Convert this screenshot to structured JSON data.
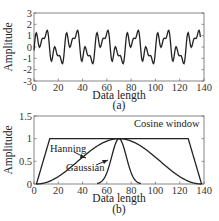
{
  "chart_data": [
    {
      "id": "a",
      "type": "line",
      "caption": "(a)",
      "xlabel": "Data length",
      "ylabel": "Amplitude",
      "xlim": [
        0,
        140
      ],
      "ylim": [
        -3,
        3
      ],
      "xticks": [
        "0",
        "20",
        "40",
        "60",
        "80",
        "100",
        "120",
        "140"
      ],
      "yticks": [
        "-3",
        "-2",
        "-1",
        "0",
        "1",
        "2",
        "3"
      ],
      "grid": false,
      "series": [
        {
          "name": "signal",
          "description": "periodic multi-harmonic signal, period ~25 samples",
          "x": [
            0,
            2,
            5,
            8,
            10,
            12,
            15,
            17,
            19,
            21,
            23,
            25,
            27,
            29,
            31,
            33,
            35,
            37
          ],
          "y": [
            0,
            0.8,
            -1.1,
            -0.7,
            -1.8,
            -0.5,
            1.7,
            0.8,
            1.2,
            -0.8,
            0.8,
            -1.1,
            -0.7,
            -1.8,
            -0.5,
            1.7,
            0.8,
            1.2
          ]
        }
      ]
    },
    {
      "id": "b",
      "type": "line",
      "caption": "(b)",
      "xlabel": "Data length",
      "ylabel": "Amplitude",
      "xlim": [
        0,
        140
      ],
      "ylim": [
        0,
        1.5
      ],
      "xticks": [
        "0",
        "20",
        "40",
        "60",
        "80",
        "100",
        "120",
        "140"
      ],
      "yticks": [
        "0",
        "0.5",
        "1",
        "1.5"
      ],
      "grid": false,
      "series": [
        {
          "name": "Cosine window",
          "x": [
            2,
            13,
            127,
            138
          ],
          "y": [
            0,
            1,
            1,
            0
          ]
        },
        {
          "name": "Hanning",
          "x": [
            2,
            20,
            40,
            70,
            100,
            120,
            138
          ],
          "y": [
            0,
            0.15,
            0.5,
            1,
            0.5,
            0.15,
            0
          ]
        },
        {
          "name": "Gaussian",
          "x": [
            55,
            60,
            65,
            70,
            75,
            80,
            85
          ],
          "y": [
            0,
            0.12,
            0.55,
            1,
            0.55,
            0.12,
            0
          ]
        }
      ],
      "annotations": [
        "Hanning",
        "Gaussian",
        "Cosine window"
      ]
    }
  ]
}
